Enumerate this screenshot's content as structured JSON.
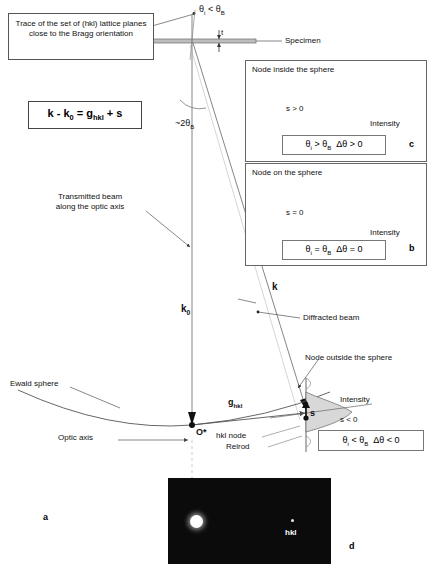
{
  "figure": {
    "equation": "k - k0 = ghkl + s",
    "equation_parts": {
      "k": "k",
      "minus": "-",
      "k0": "k",
      "k0_sub": "0",
      "eq": "=",
      "g": "g",
      "g_sub": "hkl",
      "plus": "+",
      "s": "s"
    }
  },
  "annotations": {
    "trace_box": "Trace of the set of (hkl) lattice planes close to the Bragg orientation",
    "specimen": "Specimen",
    "thickness": "t",
    "theta_incident": "θi < θB",
    "two_theta": "~2θB",
    "transmitted_beam": "Transmitted beam along the optic axis",
    "diffracted_beam": "Diffracted beam",
    "node_outside": "Node outside the sphere",
    "ewald_sphere": "Ewald sphere",
    "optic_axis": "Optic axis",
    "origin": "O*",
    "hkl_node": "hkl node",
    "relrod": "Relrod",
    "intensity": "Intensity",
    "s_negative": "s < 0",
    "vector_k0": "k0",
    "vector_k": "k",
    "vector_g": "ghkl",
    "vector_s": "s"
  },
  "main_condition": {
    "text": "θi < θB  Δθ < 0",
    "theta_i": "θi",
    "lt": "<",
    "theta_b": "θB",
    "dtheta": "Δθ",
    "lt2": "<",
    "zero": "0"
  },
  "insets": [
    {
      "id": "c",
      "panel_label": "c",
      "title": "Node inside the sphere",
      "s_label": "s > 0",
      "intensity_label": "Intensity",
      "condition": "θi > θB  Δθ > 0"
    },
    {
      "id": "b",
      "panel_label": "b",
      "title": "Node on the sphere",
      "s_label": "s = 0",
      "intensity_label": "Intensity",
      "condition": "θi = θB  Δθ = 0"
    }
  ],
  "panel_labels": {
    "a": "a",
    "d": "d"
  },
  "diffraction_pattern": {
    "panel_label": "d",
    "transmitted_spot": "bright direct beam spot",
    "diffracted_spot_label": "hkl",
    "background_color": "#0b0b0b",
    "spot_color": "#ffffff"
  },
  "colors": {
    "line": "#555555",
    "text": "#111111",
    "relrod_fill": "#d8d8d8",
    "pattern_bg": "#0b0b0b"
  }
}
